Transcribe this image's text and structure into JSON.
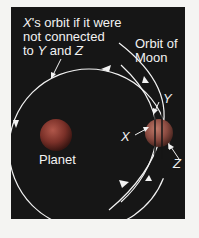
{
  "diagram": {
    "labels": {
      "x_orbit_line1_italic": "X",
      "x_orbit_line1_rest": "'s orbit if it were",
      "x_orbit_line2": "not connected",
      "x_orbit_line3_prefix": "to ",
      "x_orbit_line3_y": "Y",
      "x_orbit_line3_and": " and ",
      "x_orbit_line3_z": "Z",
      "moon_orbit_line1": "Orbit of",
      "moon_orbit_line2": "Moon",
      "planet": "Planet",
      "point_x": "X",
      "point_y": "Y",
      "point_z": "Z"
    },
    "colors": {
      "background": "#161616",
      "page": "#f4f4f2",
      "lines": "#f2f2f2",
      "planet": "#8a3a30",
      "moon": "#8a4a40"
    }
  }
}
